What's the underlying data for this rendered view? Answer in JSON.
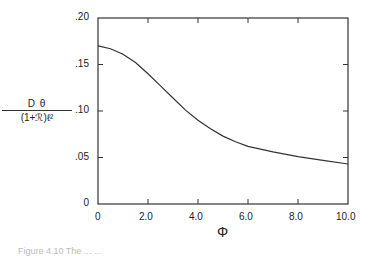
{
  "chart_data": {
    "type": "line",
    "title": "",
    "xlabel": "Φ",
    "ylabel": "D θ / (1+ℛ) ℓ²",
    "xlim": [
      0,
      10
    ],
    "ylim": [
      0,
      0.2
    ],
    "x_ticks": [
      "0",
      "2.0",
      "4.0",
      "6.0",
      "8.0",
      "10.0"
    ],
    "y_ticks": [
      "0",
      ".05",
      ".10",
      ".15",
      ".20"
    ],
    "grid": false,
    "legend": null,
    "series": [
      {
        "name": "curve",
        "x": [
          0,
          0.5,
          1.0,
          1.5,
          2.0,
          2.5,
          3.0,
          3.5,
          4.0,
          4.5,
          5.0,
          5.5,
          6.0,
          7.0,
          8.0,
          9.0,
          10.0
        ],
        "y": [
          0.17,
          0.167,
          0.161,
          0.152,
          0.14,
          0.127,
          0.114,
          0.101,
          0.09,
          0.081,
          0.073,
          0.067,
          0.062,
          0.056,
          0.051,
          0.047,
          0.043
        ]
      }
    ]
  },
  "labels": {
    "ylabel_num": "D θ",
    "ylabel_den": "(1+ℛ)ℓ²",
    "xlabel": "Φ",
    "caption": "Figure 4.10   The ... ..."
  }
}
